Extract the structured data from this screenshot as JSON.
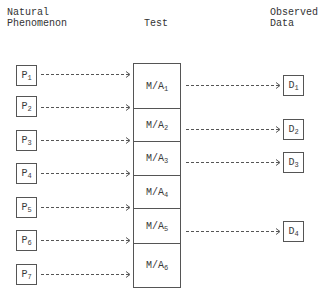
{
  "headers": {
    "left": "Natural\nPhenomenon",
    "middle": "Test",
    "right": "Observed\nData"
  },
  "phenomena": [
    {
      "label": "P",
      "sub": "1",
      "y": 65
    },
    {
      "label": "P",
      "sub": "2",
      "y": 96
    },
    {
      "label": "P",
      "sub": "3",
      "y": 130
    },
    {
      "label": "P",
      "sub": "4",
      "y": 163
    },
    {
      "label": "P",
      "sub": "5",
      "y": 197
    },
    {
      "label": "P",
      "sub": "6",
      "y": 230
    },
    {
      "label": "P",
      "sub": "7",
      "y": 264
    }
  ],
  "tests": [
    {
      "label": "M/A",
      "sub": "1",
      "top": 0,
      "height": 45
    },
    {
      "label": "M/A",
      "sub": "2",
      "top": 45,
      "height": 33
    },
    {
      "label": "M/A",
      "sub": "3",
      "top": 78,
      "height": 34
    },
    {
      "label": "M/A",
      "sub": "4",
      "top": 112,
      "height": 33
    },
    {
      "label": "M/A",
      "sub": "5",
      "top": 145,
      "height": 35
    },
    {
      "label": "M/A",
      "sub": "6",
      "top": 180,
      "height": 44
    }
  ],
  "observed": [
    {
      "label": "D",
      "sub": "1",
      "y": 75
    },
    {
      "label": "D",
      "sub": "2",
      "y": 119
    },
    {
      "label": "D",
      "sub": "3",
      "y": 152
    },
    {
      "label": "D",
      "sub": "4",
      "y": 221
    }
  ],
  "arrows_in": [
    74,
    107,
    140,
    173,
    207,
    240,
    274
  ],
  "arrows_out": [
    85,
    129,
    162,
    231
  ]
}
